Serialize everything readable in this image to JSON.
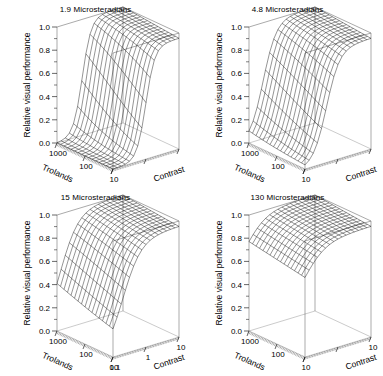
{
  "figure": {
    "title": "",
    "background": "#ffffff",
    "line_color": "#000000",
    "panel_rows": 2,
    "panel_cols": 2
  },
  "panels": [
    {
      "id": "panel-1-9",
      "title": "1.9 Microsteradians",
      "glare_source_size": 1.9,
      "glare_units": "Microsteradians",
      "show_contrast_tick_labels": false,
      "contrast_tick_labels_visible": []
    },
    {
      "id": "panel-4-8",
      "title": "4.8 Microsteradians",
      "glare_source_size": 4.8,
      "glare_units": "Microsteradians",
      "show_contrast_tick_labels": false,
      "contrast_tick_labels_visible": []
    },
    {
      "id": "panel-15",
      "title": "15 Microsteradians",
      "glare_source_size": 15,
      "glare_units": "Microsteradians",
      "show_contrast_tick_labels": true,
      "contrast_tick_labels_visible": [
        "0.1",
        "1",
        "10"
      ]
    },
    {
      "id": "panel-130",
      "title": "130 Microsteradians",
      "glare_source_size": 130,
      "glare_units": "Microsteradians",
      "show_contrast_tick_labels": false,
      "contrast_tick_labels_visible": [
        "10"
      ]
    }
  ],
  "axes": {
    "z": {
      "label": "Relative visual performance",
      "ticks": [
        "0.0",
        "0.2",
        "0.4",
        "0.6",
        "0.8",
        "1.0"
      ],
      "tick_values": [
        0.0,
        0.2,
        0.4,
        0.6,
        0.8,
        1.0
      ],
      "range": [
        0.0,
        1.0
      ],
      "minor_ticks_per_interval": 1
    },
    "x": {
      "label": "Trolands",
      "ticks": [
        "1000",
        "100",
        "10"
      ],
      "tick_values": [
        1000,
        100,
        10
      ],
      "scale": "log",
      "range": [
        10,
        1000
      ],
      "direction": "descending"
    },
    "y": {
      "label": "Contrast",
      "ticks": [
        "0.1",
        "1",
        "10"
      ],
      "tick_values": [
        0.1,
        1,
        10
      ],
      "scale": "log",
      "range": [
        0.1,
        10
      ],
      "direction": "ascending"
    }
  },
  "chart_data": {
    "type": "line",
    "subtype": "3d-wireframe-surface-grid",
    "title": "",
    "subtitle": "",
    "xlabel": "Trolands",
    "ylabel": "Contrast",
    "zlabel": "Relative visual performance",
    "xlim": [
      10,
      1000
    ],
    "ylim": [
      0.1,
      10
    ],
    "zlim": [
      0.0,
      1.0
    ],
    "xscale": "log",
    "yscale": "log",
    "grid": false,
    "legend": "none",
    "panel_variable": "glare source size (Microsteradians)",
    "panel_values": [
      1.9,
      4.8,
      15,
      130
    ],
    "mesh": {
      "nx": 17,
      "ny": 17
    },
    "x_grid_log10": [
      1.0,
      1.125,
      1.25,
      1.375,
      1.5,
      1.625,
      1.75,
      1.875,
      2.0,
      2.125,
      2.25,
      2.375,
      2.5,
      2.625,
      2.75,
      2.875,
      3.0
    ],
    "y_grid_log10": [
      -1.0,
      -0.875,
      -0.75,
      -0.625,
      -0.5,
      -0.375,
      -0.25,
      -0.125,
      0.0,
      0.125,
      0.25,
      0.375,
      0.5,
      0.625,
      0.75,
      0.875,
      1.0
    ],
    "surface_model": {
      "description": "Relative visual performance rises with contrast and trolands toward an asymptote near 1.0; a narrow trough collapses toward 0 at low contrast. Larger glare source size raises the whole surface and shallows the trough.",
      "asymptote": 1.0,
      "panel_params": [
        {
          "glare": 1.9,
          "floor": 0.0,
          "contrast_threshold_log10": -0.12,
          "sharpness": 7.4,
          "troland_gain": 0.42,
          "max_value": 1.0,
          "min_value": 0.0
        },
        {
          "glare": 4.8,
          "floor": 0.0,
          "contrast_threshold_log10": -0.46,
          "sharpness": 5.0,
          "troland_gain": 0.4,
          "max_value": 1.0,
          "min_value": 0.0
        },
        {
          "glare": 15,
          "floor": 0.0,
          "contrast_threshold_log10": -0.8,
          "sharpness": 3.6,
          "troland_gain": 0.36,
          "max_value": 1.0,
          "min_value": 0.0
        },
        {
          "glare": 130,
          "floor": 0.4,
          "contrast_threshold_log10": -1.1,
          "sharpness": 3.0,
          "troland_gain": 0.22,
          "max_value": 1.0,
          "min_value": 0.4
        }
      ]
    },
    "series": [
      {
        "name": "1.9 Microsteradians",
        "z_at_trolands_1000": [
          0.0,
          0.0,
          0.0,
          0.01,
          0.02,
          0.05,
          0.13,
          0.31,
          0.58,
          0.79,
          0.9,
          0.95,
          0.97,
          0.98,
          0.99,
          0.99,
          1.0
        ],
        "z_at_trolands_100": [
          0.0,
          0.0,
          0.0,
          0.0,
          0.01,
          0.03,
          0.09,
          0.23,
          0.48,
          0.72,
          0.86,
          0.93,
          0.96,
          0.97,
          0.98,
          0.99,
          0.99
        ],
        "z_at_trolands_10": [
          0.0,
          0.0,
          0.0,
          0.0,
          0.0,
          0.01,
          0.05,
          0.15,
          0.36,
          0.62,
          0.8,
          0.9,
          0.94,
          0.96,
          0.97,
          0.98,
          0.98
        ]
      },
      {
        "name": "4.8 Microsteradians",
        "z_at_trolands_1000": [
          0.0,
          0.02,
          0.06,
          0.15,
          0.31,
          0.52,
          0.7,
          0.83,
          0.9,
          0.94,
          0.96,
          0.98,
          0.98,
          0.99,
          0.99,
          1.0,
          1.0
        ],
        "z_at_trolands_100": [
          0.0,
          0.01,
          0.04,
          0.1,
          0.23,
          0.43,
          0.63,
          0.78,
          0.87,
          0.92,
          0.95,
          0.97,
          0.98,
          0.98,
          0.99,
          0.99,
          0.99
        ],
        "z_at_trolands_10": [
          0.0,
          0.0,
          0.02,
          0.06,
          0.15,
          0.32,
          0.53,
          0.71,
          0.83,
          0.89,
          0.93,
          0.95,
          0.97,
          0.97,
          0.98,
          0.98,
          0.99
        ]
      },
      {
        "name": "15 Microsteradians",
        "z_at_trolands_1000": [
          0.05,
          0.14,
          0.29,
          0.47,
          0.64,
          0.77,
          0.86,
          0.91,
          0.94,
          0.96,
          0.97,
          0.98,
          0.99,
          0.99,
          0.99,
          1.0,
          1.0
        ],
        "z_at_trolands_100": [
          0.02,
          0.09,
          0.21,
          0.38,
          0.56,
          0.71,
          0.82,
          0.88,
          0.92,
          0.95,
          0.96,
          0.97,
          0.98,
          0.98,
          0.99,
          0.99,
          0.99
        ],
        "z_at_trolands_10": [
          0.0,
          0.04,
          0.12,
          0.26,
          0.43,
          0.61,
          0.74,
          0.83,
          0.89,
          0.92,
          0.95,
          0.96,
          0.97,
          0.98,
          0.98,
          0.99,
          0.99
        ]
      },
      {
        "name": "130 Microsteradians",
        "z_at_trolands_1000": [
          0.48,
          0.6,
          0.71,
          0.8,
          0.87,
          0.91,
          0.94,
          0.96,
          0.97,
          0.98,
          0.98,
          0.99,
          0.99,
          0.99,
          1.0,
          1.0,
          1.0
        ],
        "z_at_trolands_100": [
          0.43,
          0.55,
          0.66,
          0.76,
          0.84,
          0.89,
          0.92,
          0.95,
          0.96,
          0.97,
          0.98,
          0.98,
          0.99,
          0.99,
          0.99,
          0.99,
          1.0
        ],
        "z_at_trolands_10": [
          0.4,
          0.48,
          0.59,
          0.7,
          0.79,
          0.86,
          0.9,
          0.93,
          0.95,
          0.96,
          0.97,
          0.98,
          0.98,
          0.99,
          0.99,
          0.99,
          0.99
        ]
      }
    ]
  }
}
